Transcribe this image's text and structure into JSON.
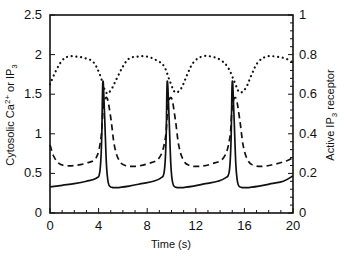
{
  "chart_data": {
    "type": "line",
    "title": "",
    "xlabel": "Time (s)",
    "ylabel_left": "Cytosolic Ca2+ or IP3",
    "ylabel_left_parts": {
      "a": "Cytosolic Ca",
      "a_sup": "2+",
      "b": " or IP",
      "b_sub": "3"
    },
    "ylabel_right": "Active IP3 receptor",
    "ylabel_right_parts": {
      "a": "Active IP",
      "a_sub": "3",
      "b": " receptor"
    },
    "xlim": [
      0,
      20
    ],
    "ylim_left": [
      0,
      2.5
    ],
    "ylim_right": [
      0,
      1
    ],
    "x_ticks": [
      0,
      4,
      8,
      12,
      16,
      20
    ],
    "x_tick_labels": [
      "0",
      "4",
      "8",
      "12",
      "16",
      "20"
    ],
    "y_left_ticks": [
      0,
      0.5,
      1,
      1.5,
      2,
      2.5
    ],
    "y_left_tick_labels": [
      "0",
      "0.5",
      "1",
      "1.5",
      "2",
      "2.5"
    ],
    "y_right_ticks": [
      0,
      0.2,
      0.4,
      0.6,
      0.8,
      1
    ],
    "y_right_tick_labels": [
      "0",
      "0.2",
      "0.4",
      "0.6",
      "0.8",
      "1"
    ],
    "grid": false,
    "legend": null,
    "series": [
      {
        "name": "Cytosolic Ca2+",
        "axis": "left",
        "style": "solid",
        "x": [
          0,
          1,
          2,
          3,
          3.8,
          4.1,
          4.25,
          4.35,
          4.5,
          4.65,
          4.8,
          5.0,
          5.5,
          6.5,
          7.5,
          8.5,
          9.1,
          9.4,
          9.55,
          9.65,
          9.8,
          9.95,
          10.1,
          10.3,
          10.8,
          11.8,
          12.8,
          13.8,
          14.4,
          14.75,
          14.9,
          15.0,
          15.15,
          15.3,
          15.45,
          15.65,
          16.2,
          17.2,
          18.2,
          19.2,
          20
        ],
        "values": [
          0.33,
          0.35,
          0.37,
          0.4,
          0.44,
          0.52,
          0.9,
          1.66,
          1.2,
          0.6,
          0.38,
          0.33,
          0.32,
          0.34,
          0.37,
          0.4,
          0.44,
          0.52,
          0.9,
          1.66,
          1.2,
          0.6,
          0.38,
          0.33,
          0.32,
          0.34,
          0.37,
          0.4,
          0.44,
          0.52,
          0.9,
          1.66,
          1.2,
          0.6,
          0.38,
          0.33,
          0.32,
          0.34,
          0.37,
          0.4,
          0.47
        ]
      },
      {
        "name": "IP3",
        "axis": "left",
        "style": "dashed",
        "x": [
          0,
          0.3,
          0.7,
          1.2,
          2,
          3,
          3.8,
          4.2,
          4.4,
          4.7,
          5.0,
          5.3,
          5.7,
          6.2,
          7,
          8,
          9.0,
          9.5,
          9.7,
          10.0,
          10.3,
          10.6,
          11.0,
          11.5,
          12.3,
          13.3,
          14.3,
          14.8,
          15.0,
          15.3,
          15.6,
          15.9,
          16.3,
          16.8,
          17.6,
          18.6,
          19.5,
          20
        ],
        "values": [
          0.86,
          0.72,
          0.63,
          0.6,
          0.6,
          0.63,
          0.7,
          0.95,
          1.35,
          1.45,
          1.2,
          0.85,
          0.66,
          0.6,
          0.59,
          0.62,
          0.7,
          0.95,
          1.35,
          1.45,
          1.2,
          0.85,
          0.66,
          0.6,
          0.59,
          0.62,
          0.7,
          0.95,
          1.35,
          1.45,
          1.2,
          0.85,
          0.66,
          0.6,
          0.59,
          0.62,
          0.66,
          0.7
        ]
      },
      {
        "name": "Active IP3 receptor",
        "axis": "right",
        "style": "dotted",
        "x": [
          0,
          0.5,
          1,
          1.5,
          2.2,
          3,
          3.6,
          4.1,
          4.6,
          5.0,
          5.5,
          6.0,
          6.5,
          7.2,
          8,
          8.8,
          9.4,
          9.9,
          10.3,
          10.8,
          11.3,
          11.8,
          12.5,
          13.3,
          14.1,
          14.7,
          15.2,
          15.6,
          16.1,
          16.6,
          17.1,
          17.8,
          18.6,
          19.4,
          20
        ],
        "values": [
          0.65,
          0.72,
          0.77,
          0.79,
          0.79,
          0.78,
          0.76,
          0.7,
          0.61,
          0.62,
          0.68,
          0.74,
          0.78,
          0.79,
          0.79,
          0.77,
          0.74,
          0.66,
          0.61,
          0.63,
          0.7,
          0.76,
          0.79,
          0.79,
          0.77,
          0.73,
          0.66,
          0.61,
          0.63,
          0.7,
          0.76,
          0.79,
          0.79,
          0.78,
          0.76
        ]
      }
    ]
  }
}
